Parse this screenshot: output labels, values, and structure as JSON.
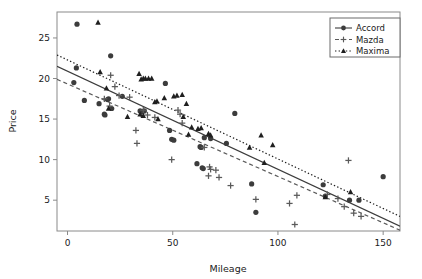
{
  "chart_data": {
    "type": "scatter",
    "title": "",
    "xlabel": "Mileage",
    "ylabel": "Price",
    "xlim": [
      -5,
      158
    ],
    "ylim": [
      1.2,
      28.2
    ],
    "xticks": [
      0,
      50,
      100,
      150
    ],
    "yticks": [
      5,
      10,
      15,
      20,
      25
    ],
    "grid": false,
    "legend_position": "top-right",
    "series": [
      {
        "name": "Accord",
        "marker": "circle",
        "line_style": "solid",
        "color": "#3c3c3c",
        "points": [
          [
            4.5,
            26.7
          ],
          [
            4.2,
            21.3
          ],
          [
            3.0,
            19.5
          ],
          [
            8.0,
            17.3
          ],
          [
            15.0,
            16.9
          ],
          [
            17.5,
            15.6
          ],
          [
            17.8,
            15.5
          ],
          [
            19.5,
            17.5
          ],
          [
            19.0,
            17.4
          ],
          [
            20.5,
            22.8
          ],
          [
            21.0,
            16.3
          ],
          [
            26.0,
            17.8
          ],
          [
            34.5,
            16.0
          ],
          [
            35.5,
            15.9
          ],
          [
            36.5,
            16.0
          ],
          [
            46.5,
            19.4
          ],
          [
            48.5,
            13.6
          ],
          [
            49.5,
            12.5
          ],
          [
            50.5,
            12.4
          ],
          [
            61.5,
            9.5
          ],
          [
            63.0,
            11.6
          ],
          [
            63.5,
            11.5
          ],
          [
            64.0,
            9.0
          ],
          [
            64.5,
            8.9
          ],
          [
            65.0,
            12.7
          ],
          [
            68.0,
            12.6
          ],
          [
            75.5,
            12.0
          ],
          [
            79.5,
            15.7
          ],
          [
            87.5,
            7.0
          ],
          [
            89.5,
            3.5
          ],
          [
            121.5,
            6.9
          ],
          [
            122.5,
            5.5
          ],
          [
            134.0,
            5.0
          ],
          [
            138.5,
            5.0
          ],
          [
            150.0,
            7.9
          ]
        ],
        "fit_line": {
          "x0": -5,
          "y0": 21.5,
          "x1": 158,
          "y1": 1.8
        }
      },
      {
        "name": "Mazda",
        "marker": "plus",
        "line_style": "dashed",
        "color": "#5a5a5a",
        "points": [
          [
            17.5,
            17.5
          ],
          [
            20.0,
            16.6
          ],
          [
            20.5,
            20.4
          ],
          [
            22.5,
            19.0
          ],
          [
            24.5,
            17.9
          ],
          [
            29.5,
            17.7
          ],
          [
            32.5,
            13.6
          ],
          [
            33.0,
            12.0
          ],
          [
            36.0,
            16.1
          ],
          [
            38.0,
            15.5
          ],
          [
            41.5,
            15.2
          ],
          [
            49.5,
            10.0
          ],
          [
            52.5,
            16.1
          ],
          [
            53.5,
            15.6
          ],
          [
            54.5,
            14.5
          ],
          [
            65.0,
            11.5
          ],
          [
            67.5,
            9.1
          ],
          [
            68.0,
            8.8
          ],
          [
            67.0,
            8.0
          ],
          [
            70.5,
            8.7
          ],
          [
            72.0,
            7.8
          ],
          [
            77.5,
            6.8
          ],
          [
            89.5,
            5.1
          ],
          [
            105.5,
            4.6
          ],
          [
            108.0,
            2.0
          ],
          [
            109.0,
            5.6
          ],
          [
            123.5,
            5.7
          ],
          [
            128.5,
            5.2
          ],
          [
            131.5,
            4.2
          ],
          [
            133.5,
            9.9
          ],
          [
            136.0,
            3.4
          ],
          [
            139.5,
            3.0
          ]
        ],
        "fit_line": {
          "x0": -5,
          "y0": 19.9,
          "x1": 158,
          "y1": 1.3
        }
      },
      {
        "name": "Maxima",
        "marker": "triangle",
        "line_style": "dotted",
        "color": "#1f1f1f",
        "points": [
          [
            14.5,
            26.9
          ],
          [
            15.5,
            20.8
          ],
          [
            18.5,
            18.8
          ],
          [
            19.5,
            16.3
          ],
          [
            28.5,
            15.3
          ],
          [
            34.0,
            20.6
          ],
          [
            35.0,
            19.9
          ],
          [
            36.0,
            20.0
          ],
          [
            37.0,
            20.0
          ],
          [
            38.5,
            20.0
          ],
          [
            40.0,
            20.0
          ],
          [
            34.5,
            15.6
          ],
          [
            36.0,
            15.4
          ],
          [
            41.5,
            17.1
          ],
          [
            42.5,
            17.2
          ],
          [
            43.0,
            15.0
          ],
          [
            46.0,
            17.6
          ],
          [
            50.5,
            17.8
          ],
          [
            52.0,
            17.9
          ],
          [
            54.5,
            18.0
          ],
          [
            56.5,
            16.9
          ],
          [
            55.0,
            15.3
          ],
          [
            59.0,
            14.0
          ],
          [
            57.5,
            13.1
          ],
          [
            62.0,
            13.8
          ],
          [
            63.5,
            13.9
          ],
          [
            67.0,
            13.2
          ],
          [
            68.0,
            13.0
          ],
          [
            86.5,
            11.5
          ],
          [
            92.0,
            13.0
          ],
          [
            93.5,
            9.6
          ],
          [
            97.5,
            11.8
          ],
          [
            122.5,
            5.4
          ],
          [
            134.5,
            6.0
          ]
        ],
        "fit_line": {
          "x0": -5,
          "y0": 22.9,
          "x1": 158,
          "y1": 3.0
        }
      }
    ]
  },
  "legend": {
    "items": [
      {
        "label": "Accord",
        "marker": "circle",
        "line": "solid"
      },
      {
        "label": "Mazda",
        "marker": "plus",
        "line": "dashed"
      },
      {
        "label": "Maxima",
        "marker": "triangle",
        "line": "dotted"
      }
    ]
  },
  "axes": {
    "x_label": "Mileage",
    "y_label": "Price",
    "x_tick_labels": [
      "0",
      "50",
      "100",
      "150"
    ],
    "y_tick_labels": [
      "5",
      "10",
      "15",
      "20",
      "25"
    ]
  },
  "colors": {
    "background": "#ffffff",
    "frame": "#8a8a8a",
    "text": "#1a1a1a",
    "accord": "#3c3c3c",
    "mazda": "#5a5a5a",
    "maxima": "#1f1f1f"
  }
}
